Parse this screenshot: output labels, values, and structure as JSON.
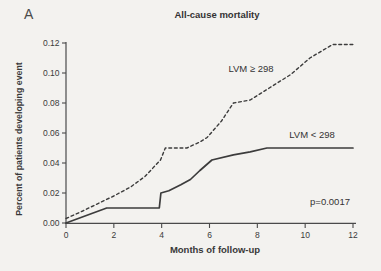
{
  "panel_label": "A",
  "colors": {
    "background": "#f3f2ef",
    "axis": "#4a4a4a",
    "line": "#3c3c3c",
    "text": "#3b3b3b"
  },
  "annotation": "p=0.0017",
  "chart_data": {
    "type": "line",
    "title": "All-cause mortality",
    "xlabel": "Months of follow-up",
    "ylabel": "Percent of patients developing event",
    "xlim": [
      0,
      12
    ],
    "ylim": [
      0,
      0.12
    ],
    "x_ticks": [
      0,
      2,
      4,
      6,
      8,
      10,
      12
    ],
    "y_ticks": [
      0,
      0.02,
      0.04,
      0.06,
      0.08,
      0.1,
      0.12
    ],
    "y_tick_labels": [
      "0.00",
      "0.02",
      "0.04",
      "0.06",
      "0.08",
      "0.10",
      "0.12"
    ],
    "grid": false,
    "legend_position": "inline-labels",
    "series": [
      {
        "name": "LVM ≥ 298",
        "style": "dashed",
        "color": "#3c3c3c",
        "points": [
          [
            0,
            0.003
          ],
          [
            0.7,
            0.008
          ],
          [
            1.4,
            0.0135
          ],
          [
            2,
            0.018
          ],
          [
            2.7,
            0.024
          ],
          [
            3.3,
            0.031
          ],
          [
            3.95,
            0.042
          ],
          [
            4.15,
            0.05
          ],
          [
            5.05,
            0.05
          ],
          [
            5.6,
            0.054
          ],
          [
            5.9,
            0.057
          ],
          [
            6.5,
            0.068
          ],
          [
            7.0,
            0.08
          ],
          [
            7.7,
            0.082
          ],
          [
            8.5,
            0.09
          ],
          [
            9.4,
            0.099
          ],
          [
            10.2,
            0.11
          ],
          [
            11.15,
            0.119
          ],
          [
            12,
            0.119
          ]
        ]
      },
      {
        "name": "LVM < 298",
        "style": "solid",
        "color": "#3c3c3c",
        "points": [
          [
            0,
            0
          ],
          [
            1.7,
            0.01
          ],
          [
            3.9,
            0.01
          ],
          [
            3.97,
            0.02
          ],
          [
            4.3,
            0.0215
          ],
          [
            4.8,
            0.0255
          ],
          [
            5.2,
            0.029
          ],
          [
            5.6,
            0.035
          ],
          [
            6.1,
            0.042
          ],
          [
            7.0,
            0.0455
          ],
          [
            7.7,
            0.0475
          ],
          [
            8.4,
            0.05
          ],
          [
            12,
            0.05
          ]
        ]
      }
    ]
  }
}
